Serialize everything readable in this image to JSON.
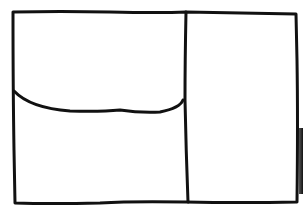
{
  "diagram": {
    "type": "hand-drawn wireframe sketch",
    "stroke_color": "#111111",
    "background_color": "#ffffff",
    "regions": [
      {
        "name": "outer-frame",
        "description": "rounded-corner outer rectangle"
      },
      {
        "name": "left-top-panel",
        "description": "upper-left region above curved divider"
      },
      {
        "name": "left-bottom-panel",
        "description": "lower-left region below curved divider"
      },
      {
        "name": "right-panel",
        "description": "tall right column region"
      }
    ],
    "dividers": [
      {
        "name": "vertical-divider",
        "orientation": "vertical"
      },
      {
        "name": "curved-divider",
        "orientation": "horizontal-curve"
      }
    ]
  }
}
